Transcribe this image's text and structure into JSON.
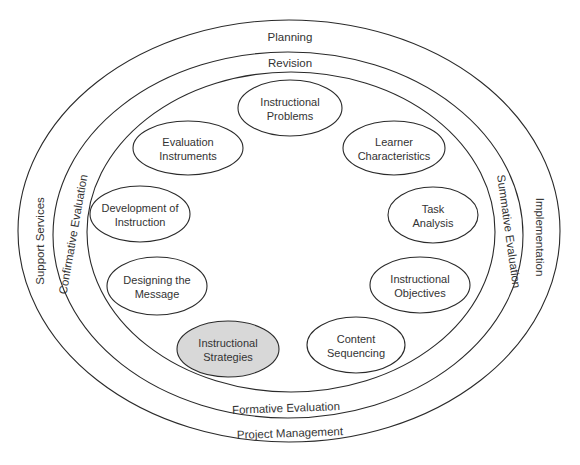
{
  "diagram": {
    "type": "concentric-ellipse-model",
    "colors": {
      "stroke": "#2a2a2a",
      "text": "#333333",
      "background": "#ffffff",
      "default_fill": "#ffffff",
      "highlight_fill": "#d8d8d8"
    },
    "rings": [
      {
        "id": "outer",
        "cx": 289,
        "cy": 231,
        "rx": 271,
        "ry": 211,
        "labels": {
          "top": "Planning",
          "bottom": "Project Management",
          "left": "Support Services",
          "right": "Implementation"
        }
      },
      {
        "id": "middle",
        "cx": 288,
        "cy": 235,
        "rx": 235,
        "ry": 183,
        "labels": {
          "top": "Revision",
          "bottom": "Formative Evaluation",
          "left": "Confirmative Evaluation",
          "right": "Summative Evaluation"
        }
      },
      {
        "id": "inner",
        "cx": 291,
        "cy": 232,
        "rx": 204,
        "ry": 160
      }
    ],
    "nodes": [
      {
        "id": "instructional-problems",
        "line1": "Instructional",
        "line2": "Problems",
        "cx": 290,
        "cy": 108,
        "rx": 52,
        "ry": 28,
        "highlighted": false
      },
      {
        "id": "learner-characteristics",
        "line1": "Learner",
        "line2": "Characteristics",
        "cx": 394,
        "cy": 148,
        "rx": 51,
        "ry": 27,
        "highlighted": false
      },
      {
        "id": "task-analysis",
        "line1": "Task",
        "line2": "Analysis",
        "cx": 433,
        "cy": 215,
        "rx": 45,
        "ry": 28,
        "highlighted": false
      },
      {
        "id": "instructional-objectives",
        "line1": "Instructional",
        "line2": "Objectives",
        "cx": 420,
        "cy": 285,
        "rx": 50,
        "ry": 28,
        "highlighted": false
      },
      {
        "id": "content-sequencing",
        "line1": "Content",
        "line2": "Sequencing",
        "cx": 356,
        "cy": 345,
        "rx": 49,
        "ry": 28,
        "highlighted": false
      },
      {
        "id": "instructional-strategies",
        "line1": "Instructional",
        "line2": "Strategies",
        "cx": 228,
        "cy": 349,
        "rx": 51,
        "ry": 28,
        "highlighted": true
      },
      {
        "id": "designing-the-message",
        "line1": "Designing the",
        "line2": "Message",
        "cx": 157,
        "cy": 286,
        "rx": 50,
        "ry": 29,
        "highlighted": false
      },
      {
        "id": "development-of-instruction",
        "line1": "Development of",
        "line2": "Instruction",
        "cx": 140,
        "cy": 214,
        "rx": 50,
        "ry": 28,
        "highlighted": false
      },
      {
        "id": "evaluation-instruments",
        "line1": "Evaluation",
        "line2": "Instruments",
        "cx": 188,
        "cy": 148,
        "rx": 55,
        "ry": 27,
        "highlighted": false
      }
    ]
  }
}
